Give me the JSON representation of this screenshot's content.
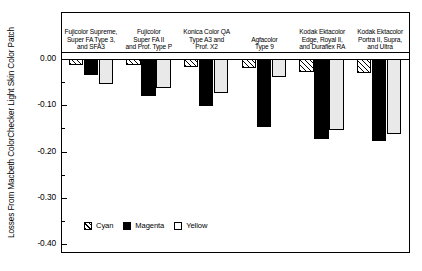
{
  "chart_data": {
    "type": "bar",
    "title": "",
    "xlabel": "",
    "ylabel": "Losses From Macbeth ColorChecker Light Skin Color Patch",
    "ylim": [
      -0.4,
      0.02
    ],
    "y_axis_range_min": -0.4,
    "y_axis_range_max": 0.02,
    "grid": false,
    "legend_position": "inside-lower-left",
    "y_ticks": [
      "0.00",
      "-0.10",
      "-0.20",
      "-0.30",
      "-0.40"
    ],
    "y_tick_values": [
      0.0,
      -0.1,
      -0.2,
      -0.3,
      -0.4
    ],
    "minor_tick_values": [
      -0.05,
      -0.15,
      -0.25,
      -0.35
    ],
    "categories": [
      "Fujicolor Supreme, Super FA Type 3, and SFA3",
      "Fujicolor Super FA II and Prof. Type P",
      "Konica Color QA Type A3 and Prof. X2",
      "Agfacolor Type 9",
      "Kodak Ektacolor Edge, Royal II, and Duraflex RA",
      "Kodak Ektacolor Portra II, Supra, and Ultra"
    ],
    "category_lines": [
      [
        "Fujicolor Supreme,",
        "Super FA Type 3,",
        "and SFA3"
      ],
      [
        "Fujicolor",
        "Super FA II",
        "and Prof. Type P"
      ],
      [
        "Konica Color QA",
        "Type A3 and",
        "Prof. X2"
      ],
      [
        "Agfacolor",
        "Type 9"
      ],
      [
        "Kodak Ektacolor",
        "Edge, Royal II,",
        "and Duraflex RA"
      ],
      [
        "Kodak Ektacolor",
        "Portra II, Supra,",
        "and Ultra"
      ]
    ],
    "series": [
      {
        "name": "Cyan",
        "fill": "hatched",
        "values": [
          -0.012,
          -0.013,
          -0.017,
          -0.019,
          -0.028,
          -0.03
        ]
      },
      {
        "name": "Magenta",
        "fill": "solid-black",
        "values": [
          -0.035,
          -0.08,
          -0.102,
          -0.147,
          -0.172,
          -0.177
        ]
      },
      {
        "name": "Yellow",
        "fill": "white",
        "values": [
          -0.055,
          -0.062,
          -0.074,
          -0.039,
          -0.153,
          -0.161
        ]
      }
    ]
  },
  "legend": {
    "items": [
      {
        "label": "Cyan"
      },
      {
        "label": "Magenta"
      },
      {
        "label": "Yellow"
      }
    ]
  },
  "colors": {
    "axis": "#000000",
    "magenta_bar": "#000000",
    "yellow_bar": "#e9e9e9",
    "background": "#ffffff"
  }
}
